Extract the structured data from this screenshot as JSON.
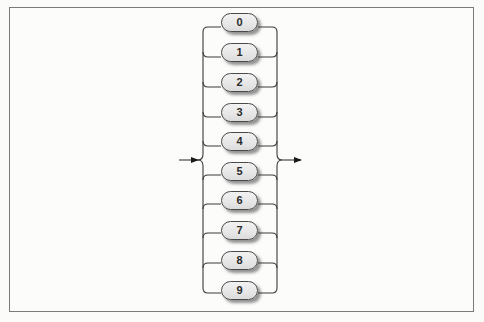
{
  "diagram": {
    "type": "railroad-syntax-diagram",
    "entry_arrow": "right-arrow",
    "exit_arrow": "right-arrow",
    "choices": [
      {
        "label": "0"
      },
      {
        "label": "1"
      },
      {
        "label": "2"
      },
      {
        "label": "3"
      },
      {
        "label": "4"
      },
      {
        "label": "5"
      },
      {
        "label": "6"
      },
      {
        "label": "7"
      },
      {
        "label": "8"
      },
      {
        "label": "9"
      }
    ]
  },
  "colors": {
    "frame": "#7a7a7a",
    "line": "#333333",
    "pill_fill": "#e6e6e6",
    "pill_border": "#4a4a4a",
    "background": "#fbfbfa"
  }
}
